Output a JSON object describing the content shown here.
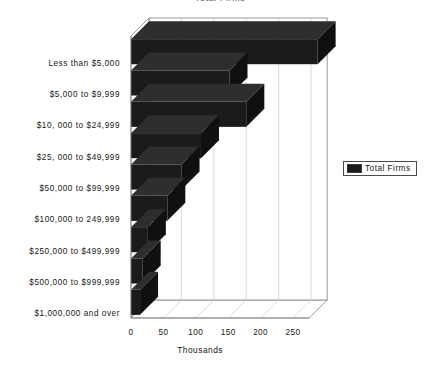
{
  "chart_data": {
    "type": "bar",
    "orientation": "horizontal",
    "style": "3d",
    "title": "Total Firms",
    "categories": [
      "Less than $5,000",
      "$5,000 to $9,999",
      "$10, 000 to $24,999",
      "$25, 000 to $49,999",
      "$50,000 to $99,999",
      "$100,000 to 249,999",
      "$250,000 to $499,999",
      "$500,000 to $999,999",
      "$1,000,000 and over"
    ],
    "series": [
      {
        "name": "Total Firms",
        "color": "#1b1b1b",
        "values": [
          288,
          152,
          178,
          108,
          78,
          56,
          26,
          18,
          14
        ]
      }
    ],
    "xlabel": "Thousands",
    "ylabel": "",
    "xticks": [
      0,
      50,
      100,
      150,
      200,
      250
    ],
    "xlim": [
      0,
      275
    ],
    "grid": true,
    "grid_axis": "x",
    "legend": {
      "position": "right",
      "entries": [
        {
          "label": "Total Firms",
          "color": "#1b1b1b"
        }
      ]
    }
  },
  "axes": {
    "x_title": "Thousands"
  },
  "legend": {
    "title": "Total Firms"
  },
  "colors": {
    "bar_front": "#1b1b1b",
    "bar_top": "#2e2e2e",
    "bar_side": "#101010",
    "grid": "#c9c9c9",
    "axis": "#808080",
    "background": "#ffffff",
    "text": "#161616"
  }
}
